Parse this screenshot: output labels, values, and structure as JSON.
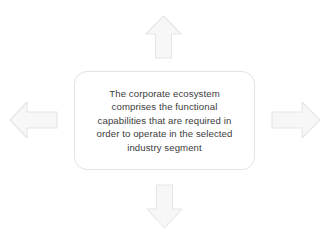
{
  "diagram": {
    "type": "four-way-arrow-concept",
    "background_color": "#ffffff",
    "center_box": {
      "name": "corporate-ecosystem-statement",
      "text": "The corporate ecosystem\ncomprises the functional\ncapabilities that are required in\norder to operate in the selected\nindustry segment",
      "lines": [
        "The corporate ecosystem",
        "comprises the functional",
        "capabilities that are required in",
        "order to operate in the selected",
        "industry segment"
      ],
      "text_color": "#3c3c3c",
      "fill_color": "#ffffff",
      "border_color": "#e3e3e3"
    },
    "arrows": [
      {
        "id": "arrow-up",
        "direction": "up",
        "label": "",
        "fill_color": "#f7f7f7",
        "border_color": "#e6e6e6"
      },
      {
        "id": "arrow-right",
        "direction": "right",
        "label": "",
        "fill_color": "#f7f7f7",
        "border_color": "#e6e6e6"
      },
      {
        "id": "arrow-down",
        "direction": "down",
        "label": "",
        "fill_color": "#f7f7f7",
        "border_color": "#e6e6e6"
      },
      {
        "id": "arrow-left",
        "direction": "left",
        "label": "",
        "fill_color": "#f7f7f7",
        "border_color": "#e6e6e6"
      }
    ]
  }
}
